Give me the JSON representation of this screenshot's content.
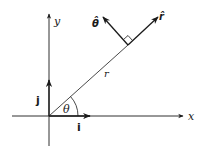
{
  "diagram": {
    "axes": {
      "x_label": "x",
      "y_label": "y"
    },
    "vectors": {
      "i_label": "i",
      "j_label": "j",
      "r_hat_label": "r̂",
      "theta_hat_label": "θ̂"
    },
    "radius_label": "r",
    "angle_label": "θ",
    "colors": {
      "stroke": "#1a1a1a",
      "background": "#ffffff"
    }
  }
}
